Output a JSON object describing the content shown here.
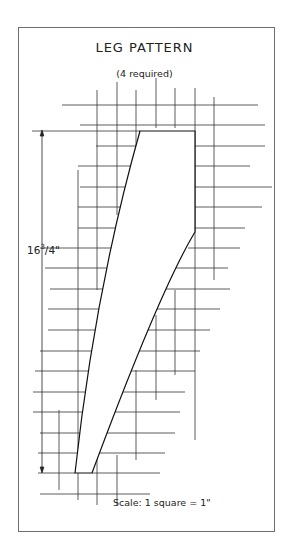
{
  "diagram": {
    "title": "LEG PATTERN",
    "subtitle": "(4 required)",
    "dimension": {
      "whole": "16",
      "numerator": "3",
      "fraction_rest": "/4\"",
      "inches": 16.75
    },
    "scale_label": "Scale: 1 square = 1\"",
    "colors": {
      "line": "#222222",
      "grid": "#333333",
      "frame": "#6e6e6e",
      "fill": "#ffffff"
    }
  }
}
